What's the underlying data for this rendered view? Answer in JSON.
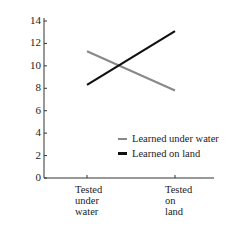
{
  "chart_data": {
    "type": "line",
    "title": "",
    "xlabel": "",
    "ylabel": "Number of words recalled",
    "categories": [
      "Tested under water",
      "Tested on land"
    ],
    "category_lines": [
      [
        "Tested",
        "under",
        "water"
      ],
      [
        "Tested",
        "on",
        "land"
      ]
    ],
    "series": [
      {
        "name": "Learned under water",
        "values": [
          11.3,
          7.8
        ],
        "color": "#888888"
      },
      {
        "name": "Learned on land",
        "values": [
          8.3,
          13.1
        ],
        "color": "#111111"
      }
    ],
    "yticks": [
      0,
      2,
      4,
      6,
      8,
      10,
      12,
      14
    ],
    "ylim": [
      0,
      14
    ],
    "grid": false,
    "legend_position": "lower right inside"
  }
}
